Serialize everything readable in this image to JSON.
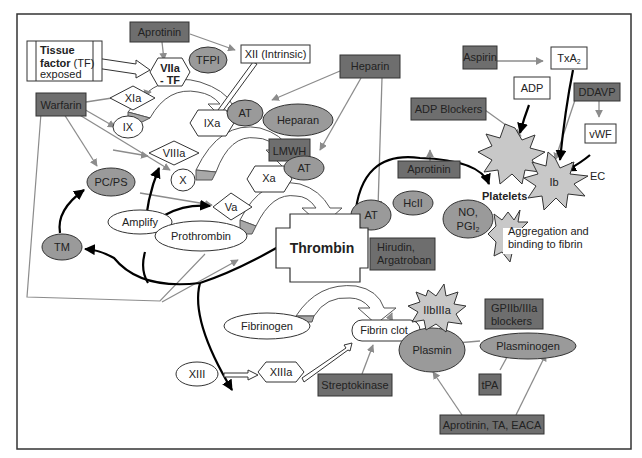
{
  "colors": {
    "drug_box": "#6e6e6e",
    "protein_oval": "#9a9a9a",
    "platelet_star": "#c8c8c8",
    "arrow_gray": "#8c8c8c",
    "arrow_black": "#000000",
    "outline": "#333333",
    "curve_fill": "#a8a8a8"
  },
  "frame": {
    "x": 17,
    "y": 14,
    "width": 614,
    "height": 435
  },
  "nodes": {
    "tissue_factor": {
      "line1": "Tissue",
      "line2_bold": "factor",
      "line2_rest": " (TF)",
      "line3": "exposed"
    },
    "aprotinin_top": "Aprotinin",
    "tfpi": "TFPI",
    "xii": "XII (Intrinsic)",
    "viia_tf": {
      "line1": "VIIa",
      "line2": "- TF"
    },
    "warfarin": "Warfarin",
    "xia": "XIa",
    "ix": "IX",
    "ixa": "IXa",
    "heparin": "Heparin",
    "at_1": "AT",
    "heparan": "Heparan",
    "viiia": "VIIIa",
    "lmwh": "LMWH",
    "at_2": "AT",
    "x": "X",
    "xa": "Xa",
    "pc_ps": "PC/PS",
    "va": "Va",
    "amplify": "Amplify",
    "prothrombin": "Prothrombin",
    "tm": "TM",
    "thrombin": "Thrombin",
    "at_3": "AT",
    "hcii": "HcII",
    "aprotinin_mid": "Aprotinin",
    "hirudin": {
      "line1": "Hirudin,",
      "line2": "Argatroban"
    },
    "aspirin": "Aspirin",
    "txa2": {
      "base": "TxA",
      "sub": "2"
    },
    "adp": "ADP",
    "ddavp": "DDAVP",
    "adp_blockers": "ADP Blockers",
    "vwf": "vWF",
    "ib": "Ib",
    "ec": "EC",
    "platelets": "Platelets",
    "no_pgi2": {
      "line1": "NO,",
      "line2_base": "PGI",
      "line2_sub": "2"
    },
    "aggregation": {
      "line1": "Aggregation and",
      "line2": "binding to fibrin"
    },
    "fibrinogen": "Fibrinogen",
    "fibrin_clot": "Fibrin clot",
    "iibiiia": "IIbIIIa",
    "gpiib_blockers": {
      "line1": "GPIIb/IIIa",
      "line2": "blockers"
    },
    "plasmin": "Plasmin",
    "plasminogen": "Plasminogen",
    "tpa": "tPA",
    "xiii": "XIII",
    "xiiia": "XIIIa",
    "streptokinase": "Streptokinase",
    "aprotinin_ta_eaca": "Aprotinin, TA, EACA"
  }
}
